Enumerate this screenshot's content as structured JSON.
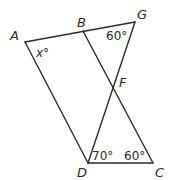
{
  "diagram": {
    "type": "geometry",
    "points": {
      "A": {
        "label": "A",
        "x": 25,
        "y": 42
      },
      "B": {
        "label": "B",
        "x": 83,
        "y": 31
      },
      "G": {
        "label": "G",
        "x": 135,
        "y": 22
      },
      "F": {
        "label": "F",
        "x": 113,
        "y": 83
      },
      "D": {
        "label": "D",
        "x": 88,
        "y": 163
      },
      "C": {
        "label": "C",
        "x": 153,
        "y": 163
      }
    },
    "segments": [
      {
        "from": "A",
        "to": "G"
      },
      {
        "from": "A",
        "to": "D"
      },
      {
        "from": "B",
        "to": "C"
      },
      {
        "from": "G",
        "to": "D"
      },
      {
        "from": "D",
        "to": "C"
      }
    ],
    "angles": {
      "A": {
        "label": "x°",
        "vertex": "A"
      },
      "G": {
        "label": "60°",
        "vertex": "G"
      },
      "D": {
        "label": "70°",
        "vertex": "D"
      },
      "C": {
        "label": "60°",
        "vertex": "C"
      }
    },
    "line_color": "#2a2a2a"
  }
}
